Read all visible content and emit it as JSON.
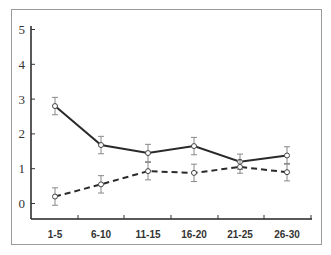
{
  "chart_data": {
    "type": "line",
    "title": "",
    "xlabel": "",
    "ylabel": "",
    "categories": [
      "1-5",
      "6-10",
      "11-15",
      "16-20",
      "21-25",
      "26-30"
    ],
    "ylim": [
      -0.5,
      5.2
    ],
    "yticks": [
      0,
      1,
      2,
      3,
      4,
      5
    ],
    "grid": false,
    "legend": null,
    "series": [
      {
        "name": "Series A (solid)",
        "style": "solid",
        "marker": "open-circle",
        "values": [
          2.8,
          1.68,
          1.45,
          1.65,
          1.2,
          1.38
        ],
        "error": [
          0.25,
          0.25,
          0.25,
          0.25,
          0.22,
          0.25
        ]
      },
      {
        "name": "Series B (dashed)",
        "style": "dashed",
        "marker": "open-circle",
        "values": [
          0.2,
          0.55,
          0.93,
          0.88,
          1.05,
          0.9
        ],
        "error": [
          0.25,
          0.25,
          0.25,
          0.25,
          0.18,
          0.25
        ]
      }
    ]
  },
  "axis": {
    "y_labels": [
      "0",
      "1",
      "2",
      "3",
      "4",
      "5"
    ],
    "x_labels": [
      "1-5",
      "6-10",
      "11-15",
      "16-20",
      "21-25",
      "26-30"
    ]
  },
  "colors": {
    "line": "#2a2a2a",
    "errorbar": "#888888",
    "frame": "#9a9a9a"
  }
}
